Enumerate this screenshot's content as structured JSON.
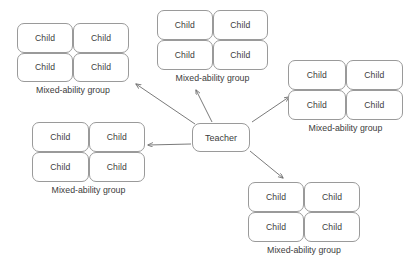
{
  "diagram": {
    "center_node": {
      "label": "Teacher"
    },
    "child_label": "Child",
    "group_caption": "Mixed-ability group",
    "colors": {
      "background": "#ffffff",
      "box_stroke": "#9a9a9a",
      "text": "#3c3c3c",
      "arrow": "#6b6b6b"
    },
    "groups": [
      {
        "id": "top-left",
        "caption": "Mixed-ability group",
        "children": [
          "Child",
          "Child",
          "Child",
          "Child"
        ]
      },
      {
        "id": "top-middle",
        "caption": "Mixed-ability group",
        "children": [
          "Child",
          "Child",
          "Child",
          "Child"
        ]
      },
      {
        "id": "right",
        "caption": "Mixed-ability group",
        "children": [
          "Child",
          "Child",
          "Child",
          "Child"
        ]
      },
      {
        "id": "bottom-left",
        "caption": "Mixed-ability group",
        "children": [
          "Child",
          "Child",
          "Child",
          "Child"
        ]
      },
      {
        "id": "bottom-right",
        "caption": "Mixed-ability group",
        "children": [
          "Child",
          "Child",
          "Child",
          "Child"
        ]
      }
    ],
    "connections": [
      {
        "from": "Teacher",
        "to": "top-left"
      },
      {
        "from": "Teacher",
        "to": "top-middle"
      },
      {
        "from": "Teacher",
        "to": "right"
      },
      {
        "from": "Teacher",
        "to": "bottom-left"
      },
      {
        "from": "Teacher",
        "to": "bottom-right"
      }
    ]
  }
}
